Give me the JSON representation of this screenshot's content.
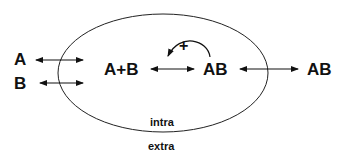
{
  "diagram": {
    "species": {
      "a_outside": "A",
      "b_outside": "B",
      "complex_formation": "A+B",
      "complex_inside": "AB",
      "complex_outside": "AB"
    },
    "feedback_sign": "+",
    "compartments": {
      "inside": "intra",
      "outside": "extra"
    },
    "colors": {
      "stroke": "#111111",
      "background": "#ffffff"
    }
  }
}
